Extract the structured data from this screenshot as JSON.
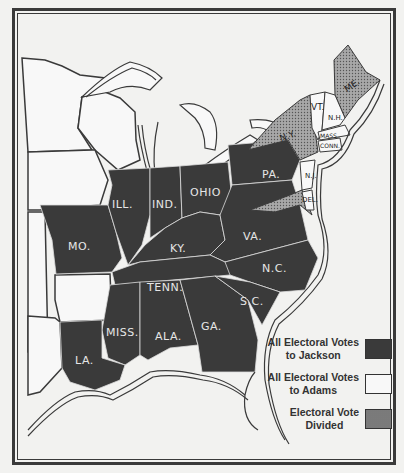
{
  "map": {
    "title": "Election of 1828",
    "colors": {
      "jackson": "#3a3a3a",
      "adams": "#f8f8f8",
      "divided": "#9a9a9a",
      "border": "#3a3a3a"
    },
    "states_jackson": [
      "ILL.",
      "IND.",
      "OHIO",
      "PA.",
      "MO.",
      "KY.",
      "VA.",
      "TENN.",
      "N.C.",
      "MISS.",
      "ALA.",
      "GA.",
      "S.C.",
      "LA."
    ],
    "states_adams": [
      "VT.",
      "N.H.",
      "MASS.",
      "CONN.",
      "R.I.",
      "N.J.",
      "DEL."
    ],
    "states_divided": [
      "N.Y.",
      "ME.",
      "MD."
    ],
    "labels": {
      "ill": "ILL.",
      "ind": "IND.",
      "ohio": "OHIO",
      "pa": "PA.",
      "mo": "MO.",
      "ky": "KY.",
      "va": "VA.",
      "tenn": "TENN.",
      "nc": "N.C.",
      "miss": "MISS.",
      "ala": "ALA.",
      "ga": "GA.",
      "sc": "S.C.",
      "la": "LA.",
      "ny": "N.Y.",
      "vt": "VT.",
      "nh": "N.H.",
      "me": "ME.",
      "mass": "MASS.",
      "conn": "CONN.",
      "nj": "N.J.",
      "del": "DEL."
    }
  },
  "legend": {
    "items": [
      {
        "line1": "All Electoral Votes",
        "line2": "to Jackson"
      },
      {
        "line1": "All Electoral Votes",
        "line2": "to Adams"
      },
      {
        "line1": "Electoral Vote",
        "line2": "Divided"
      }
    ]
  }
}
